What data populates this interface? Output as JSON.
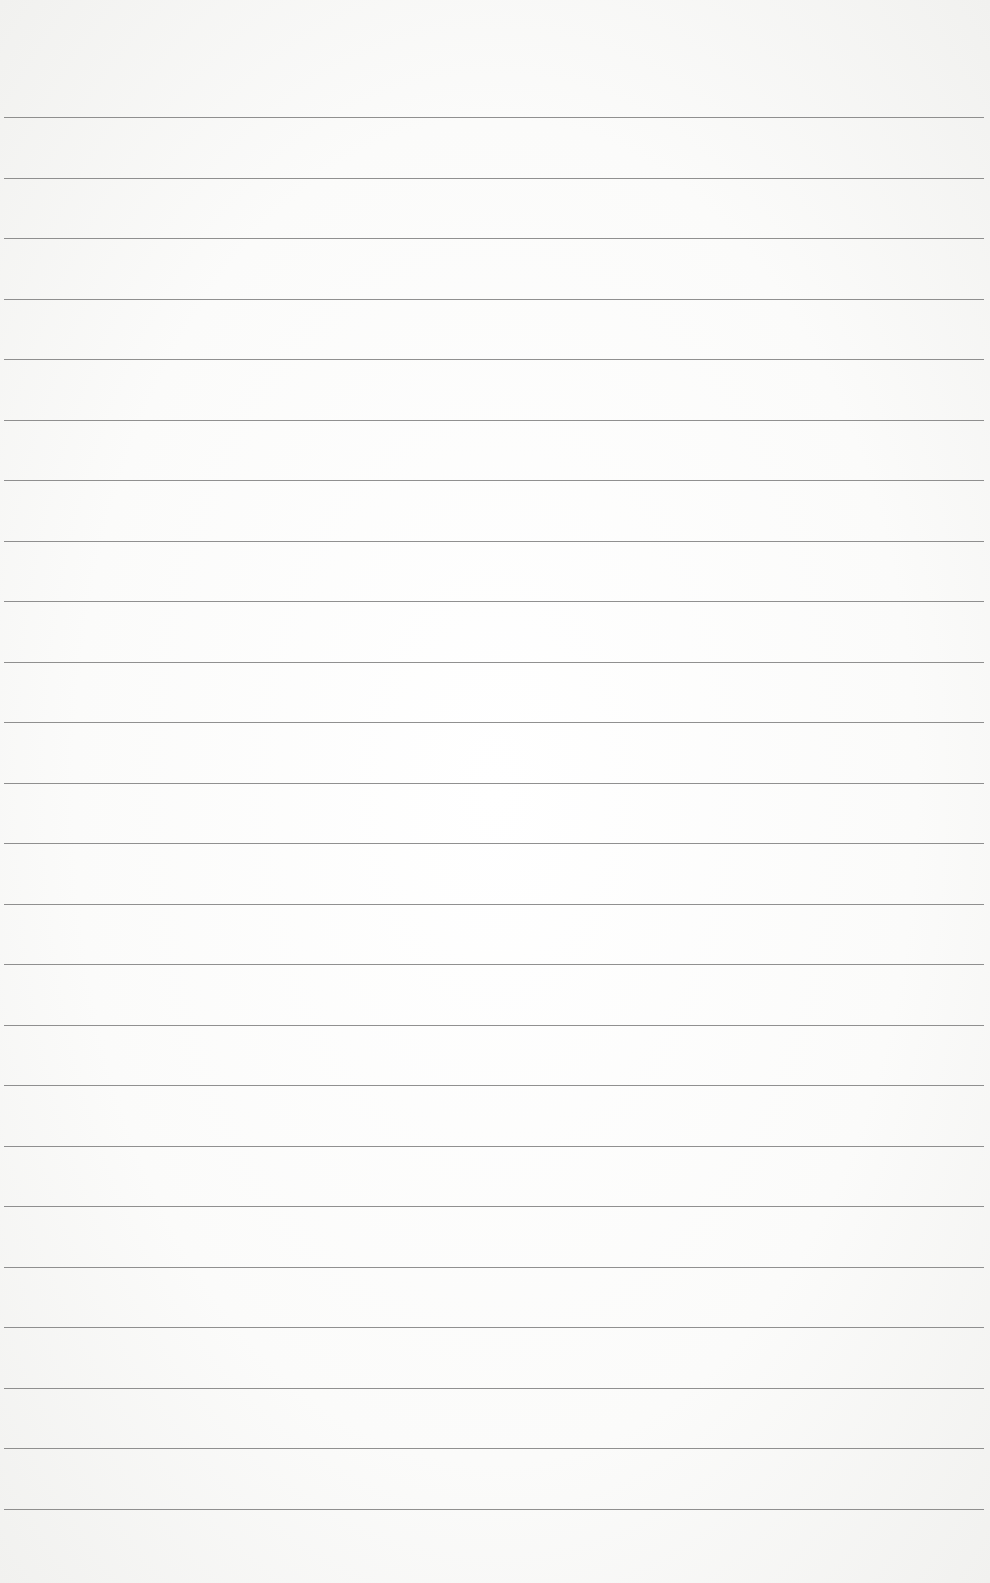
{
  "page": {
    "type": "blank lined paper",
    "line_count": 24,
    "first_line_y": 117,
    "line_spacing": 60.5,
    "background_color": "#fbfbfa",
    "line_color": "#7d7d7d"
  }
}
